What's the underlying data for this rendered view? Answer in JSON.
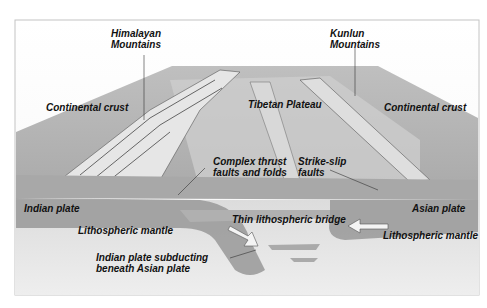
{
  "diagram": {
    "type": "geological cross-section",
    "labels": {
      "himalayan": [
        "Himalayan",
        "Mountains"
      ],
      "kunlun": [
        "Kunlun",
        "Mountains"
      ],
      "continental_crust_left": "Continental crust",
      "tibetan_plateau": "Tibetan Plateau",
      "continental_crust_right": "Continental crust",
      "complex_thrust": [
        "Complex thrust",
        "faults and folds"
      ],
      "strike_slip": [
        "Strike-slip",
        "faults"
      ],
      "indian_plate": "Indian plate",
      "asian_plate": "Asian plate",
      "thin_bridge": "Thin lithospheric bridge",
      "lithospheric_mantle_left": "Lithospheric mantle",
      "lithospheric_mantle_right": "Lithospheric mantle",
      "subducting": [
        "Indian plate subducting",
        "beneath Asian plate"
      ]
    },
    "colors": {
      "frame": "#bdbdbd",
      "crust": "#b8b8b8",
      "plateau": "#c9c9c9",
      "mantle": "#9a9a9a",
      "asthenosphere": "#e4e4e4"
    }
  }
}
